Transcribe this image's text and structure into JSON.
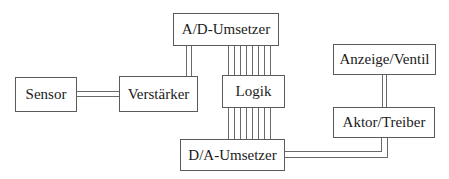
{
  "diagram": {
    "title": "",
    "blocks": {
      "sensor": "Sensor",
      "verstaerker": "Verstärker",
      "ad": "A/D-Umsetzer",
      "logik": "Logik",
      "da": "D/A-Umsetzer",
      "anzeige": "Anzeige/Ventil",
      "aktor": "Aktor/Treiber"
    },
    "connections": [
      {
        "from": "Sensor",
        "to": "Verstärker",
        "lines": 2
      },
      {
        "from": "Verstärker",
        "to": "A/D-Umsetzer",
        "lines": 2
      },
      {
        "from": "A/D-Umsetzer",
        "to": "Logik",
        "lines": 8
      },
      {
        "from": "Logik",
        "to": "D/A-Umsetzer",
        "lines": 8
      },
      {
        "from": "D/A-Umsetzer",
        "to": "Aktor/Treiber",
        "lines": 2
      },
      {
        "from": "Aktor/Treiber",
        "to": "Anzeige/Ventil",
        "lines": 2
      }
    ]
  }
}
